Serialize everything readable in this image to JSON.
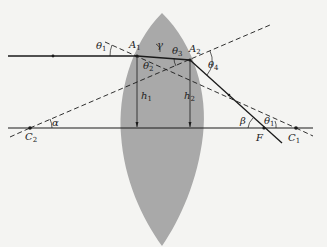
{
  "diagram": {
    "colors": {
      "background": "#f4f4f2",
      "lens": "#a9a9a9",
      "line": "#1a1a1a"
    },
    "points": {
      "A1": {
        "label": "A",
        "sub": "1"
      },
      "A2": {
        "label": "A",
        "sub": "2"
      },
      "C1": {
        "label": "C",
        "sub": "1"
      },
      "C2": {
        "label": "C",
        "sub": "2"
      },
      "F": {
        "label": "F",
        "sub": ""
      }
    },
    "heights": {
      "h1": {
        "label": "h",
        "sub": "1"
      },
      "h2": {
        "label": "h",
        "sub": "2"
      }
    },
    "angles": {
      "theta1_top": {
        "label": "θ",
        "sub": "1"
      },
      "theta2": {
        "label": "θ",
        "sub": "2"
      },
      "theta3": {
        "label": "θ",
        "sub": "3"
      },
      "theta4": {
        "label": "θ",
        "sub": "4"
      },
      "theta1_bottom": {
        "label": "θ",
        "sub": "1"
      },
      "gamma": {
        "label": "γ",
        "sub": ""
      },
      "alpha": {
        "label": "α",
        "sub": ""
      },
      "beta": {
        "label": "β",
        "sub": ""
      }
    }
  }
}
